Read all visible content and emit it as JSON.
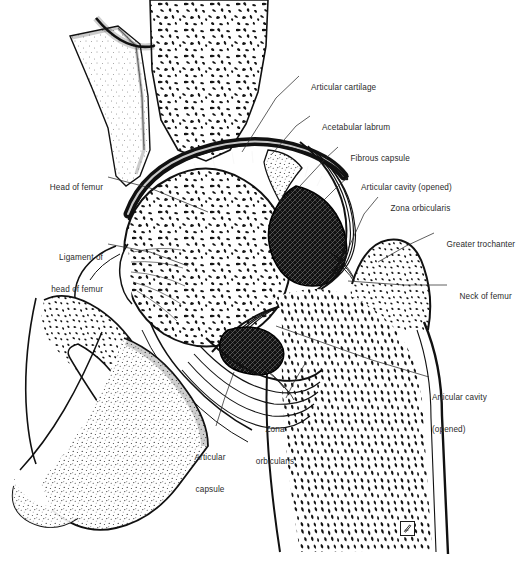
{
  "figure": {
    "background_color": "#ffffff",
    "ink_color": "#1a1a1a",
    "label_color": "#2b2b2b",
    "width": 530,
    "height": 564
  },
  "labels": [
    {
      "id": "articular-cartilage",
      "text": "Articular cartilage",
      "side": "right",
      "x": 302,
      "y": 72,
      "lines": [
        "Articular cartilage"
      ]
    },
    {
      "id": "acetabular-labrum",
      "text": "Acetabular labrum",
      "side": "right",
      "x": 313,
      "y": 112,
      "lines": [
        "Acetabular labrum"
      ]
    },
    {
      "id": "fibrous-capsule",
      "text": "Fibrous capsule",
      "side": "right",
      "x": 341,
      "y": 143,
      "lines": [
        "Fibrous capsule"
      ]
    },
    {
      "id": "articular-cavity-opened-upper",
      "text": "Articular cavity (opened)",
      "side": "right",
      "x": 352,
      "y": 172,
      "lines": [
        "Articular cavity (opened)"
      ]
    },
    {
      "id": "zona-orbicularis-upper",
      "text": "Zona orbicularis",
      "side": "right",
      "x": 381,
      "y": 193,
      "lines": [
        "Zona orbicularis"
      ]
    },
    {
      "id": "greater-trochanter",
      "text": "Greater trochanter",
      "side": "right",
      "x": 437,
      "y": 229,
      "lines": [
        "Greater trochanter"
      ]
    },
    {
      "id": "neck-of-femur",
      "text": "Neck of femur",
      "side": "right",
      "x": 450,
      "y": 281,
      "lines": [
        "Neck of femur"
      ]
    },
    {
      "id": "articular-cavity-opened-lower",
      "text": "Articular cavity (opened)",
      "side": "right",
      "x": 432,
      "y": 372,
      "lines": [
        "Articular cavity",
        "(opened)"
      ]
    },
    {
      "id": "head-of-femur",
      "text": "Head of femur",
      "side": "left",
      "x": 103,
      "y": 172,
      "lines": [
        "Head of femur"
      ]
    },
    {
      "id": "ligament-of-head-of-femur",
      "text": "Ligament of head of femur",
      "side": "left",
      "x": 103,
      "y": 232,
      "lines": [
        "Ligament of",
        "head of femur"
      ]
    },
    {
      "id": "zona-orbicularis-lower",
      "text": "Zona orbicularis",
      "side": "center",
      "x": 275,
      "y": 404,
      "lines": [
        "Zona",
        "orbicularis"
      ]
    },
    {
      "id": "articular-capsule",
      "text": "Articular capsule",
      "side": "center",
      "x": 210,
      "y": 432,
      "lines": [
        "Articular",
        "capsule"
      ]
    }
  ],
  "structures": [
    {
      "id": "ilium",
      "name": "Ilium (cut, cancellous bone)"
    },
    {
      "id": "pubis",
      "name": "Superior pubic ramus (stippled)"
    },
    {
      "id": "acetabulum",
      "name": "Acetabulum"
    },
    {
      "id": "femoral-head",
      "name": "Head of femur (cancellous bone)"
    },
    {
      "id": "femoral-neck",
      "name": "Neck of femur"
    },
    {
      "id": "greater-trochanter",
      "name": "Greater trochanter"
    },
    {
      "id": "femoral-shaft",
      "name": "Shaft of femur"
    },
    {
      "id": "articular-cartilage-band",
      "name": "Articular cartilage band"
    },
    {
      "id": "labrum",
      "name": "Acetabular labrum"
    },
    {
      "id": "capsule",
      "name": "Fibrous capsule with zona orbicularis"
    },
    {
      "id": "joint-cavity-upper",
      "name": "Articular cavity (superior, opened)"
    },
    {
      "id": "joint-cavity-lower",
      "name": "Articular cavity (inferior, opened)"
    },
    {
      "id": "ligament-teres",
      "name": "Ligament of head of femur"
    }
  ],
  "signature": {
    "present": true,
    "mark": "artist monogram"
  }
}
